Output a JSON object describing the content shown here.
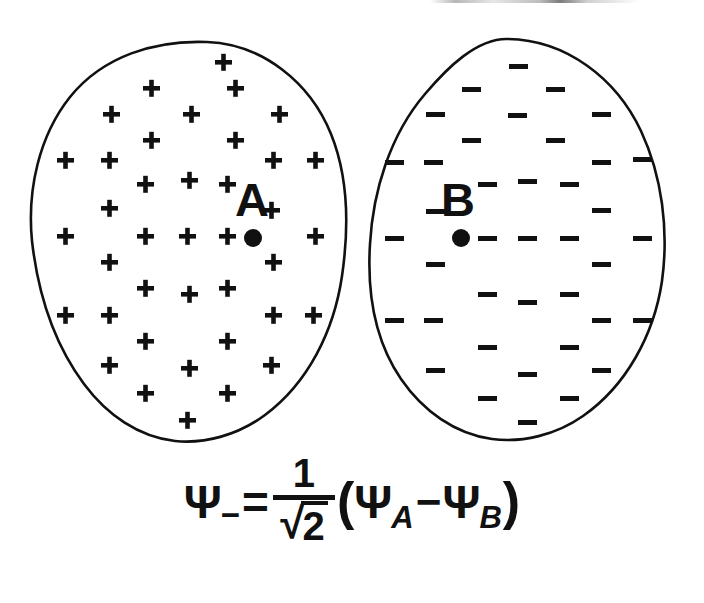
{
  "figure": {
    "title": "Antibonding molecular orbital formed from two atomic orbitals of opposite sign",
    "background_color": "#ffffff",
    "ink_color": "#111111",
    "width": 704,
    "height": 603
  },
  "lobes": [
    {
      "id": "lobe-a",
      "atom_label": "A",
      "sign_symbol": "+",
      "sign_name": "plus-sign",
      "sign_count": 40,
      "nucleus_marker": "filled-dot",
      "center_x": 187,
      "center_y": 241,
      "radius_x": 157,
      "radius_y": 200,
      "label_x": 252,
      "label_y": 216,
      "nucleus_x": 253,
      "nucleus_y": 238
    },
    {
      "id": "lobe-b",
      "atom_label": "B",
      "sign_symbol": "−",
      "sign_name": "minus-sign",
      "sign_count": 40,
      "nucleus_marker": "filled-dot",
      "center_x": 528,
      "center_y": 241,
      "radius_x": 157,
      "radius_y": 200,
      "label_x": 458,
      "label_y": 216,
      "nucleus_x": 461,
      "nucleus_y": 238
    }
  ],
  "sign_grid": {
    "description": "staggered lattice of charge-sign glyphs filling each lobe",
    "columns_x": [
      -130,
      -98,
      -66,
      -34,
      -2,
      30,
      62,
      94,
      126
    ],
    "rows_y": [
      -181,
      -155,
      -129,
      -103,
      -77,
      -51,
      -25,
      1,
      27,
      53,
      79,
      105,
      131,
      157,
      181
    ],
    "plus_positions": [
      [
        33,
        42
      ],
      [
        -31,
        42
      ],
      [
        -63,
        68
      ],
      [
        1,
        68
      ],
      [
        65,
        68
      ],
      [
        -95,
        94
      ],
      [
        -31,
        94
      ],
      [
        33,
        94
      ],
      [
        -127,
        120
      ],
      [
        -63,
        120
      ],
      [
        65,
        120
      ],
      [
        129,
        120
      ],
      [
        -63,
        146
      ],
      [
        1,
        146
      ],
      [
        65,
        146
      ],
      [
        -95,
        172
      ],
      [
        97,
        172
      ],
      [
        -127,
        198
      ],
      [
        -63,
        198
      ],
      [
        1,
        198
      ],
      [
        65,
        198
      ],
      [
        129,
        198
      ],
      [
        -95,
        224
      ],
      [
        97,
        224
      ],
      [
        -63,
        250
      ],
      [
        1,
        250
      ],
      [
        65,
        250
      ],
      [
        -127,
        276
      ],
      [
        -95,
        276
      ],
      [
        65,
        276
      ],
      [
        129,
        276
      ],
      [
        -63,
        302
      ],
      [
        65,
        302
      ],
      [
        -95,
        328
      ],
      [
        1,
        328
      ],
      [
        97,
        328
      ],
      [
        -63,
        354
      ],
      [
        65,
        354
      ],
      [
        1,
        380
      ]
    ]
  },
  "equation": {
    "id": "antibonding-wavefunction",
    "lhs_symbol": "Ψ",
    "lhs_subscript": "−",
    "equals": "=",
    "fraction_numerator": "1",
    "fraction_denominator_radicand": "2",
    "sqrt_glyph": "√",
    "open_paren": "(",
    "term1_symbol": "Ψ",
    "term1_subscript": "A",
    "operator": "−",
    "term2_symbol": "Ψ",
    "term2_subscript": "B",
    "close_paren": ")",
    "plain_text": "Ψ₋ = 1/√2 (Ψₐ − Ψᵦ)"
  }
}
